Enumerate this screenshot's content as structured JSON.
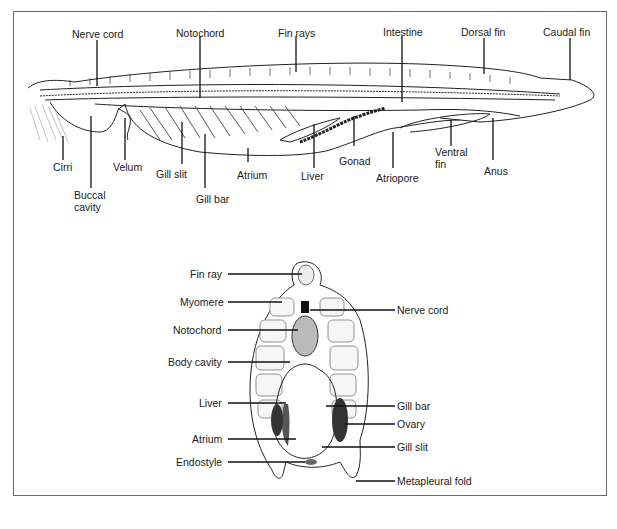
{
  "figure": {
    "longitudinal_section": {
      "labels": {
        "nerve_cord": "Nerve cord",
        "notochord": "Notochord",
        "fin_rays": "Fin rays",
        "intestine": "Intestine",
        "dorsal_fin": "Dorsal fin",
        "caudal_fin": "Caudal fin",
        "cirri": "Cirri",
        "buccal_cavity_1": "Buccal",
        "buccal_cavity_2": "cavity",
        "velum": "Velum",
        "gill_slit": "Gill slit",
        "gill_bar": "Gill bar",
        "atrium": "Atrium",
        "liver": "Liver",
        "gonad": "Gonad",
        "atriopore": "Atriopore",
        "ventral_fin_1": "Ventral",
        "ventral_fin_2": "fin",
        "anus": "Anus"
      }
    },
    "cross_section": {
      "labels": {
        "fin_ray": "Fin ray",
        "myomere": "Myomere",
        "notochord": "Notochord",
        "body_cavity": "Body cavity",
        "liver": "Liver",
        "atrium": "Atrium",
        "endostyle": "Endostyle",
        "nerve_cord": "Nerve cord",
        "gill_bar": "Gill bar",
        "ovary": "Ovary",
        "gill_slit": "Gill slit",
        "metapleural_fold": "Metapleural fold"
      }
    }
  },
  "colors": {
    "line": "#111111",
    "frame": "#6a6a6a",
    "background": "#ffffff"
  }
}
